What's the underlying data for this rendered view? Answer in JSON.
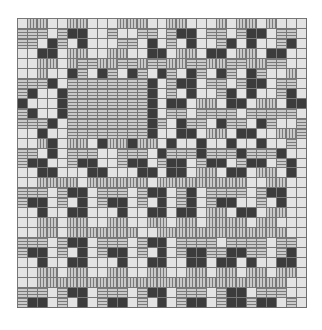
{
  "figure": {
    "type": "weave-draft-pattern",
    "columns": 29,
    "rows": 29,
    "legend": {
      ".": "light cell",
      "v": "vertical-striped cell",
      "h": "horizontal-striped cell",
      "d": "dark cell",
      "m": "mid-gray cell"
    },
    "colors": {
      "light": "#e3e3e3",
      "stripe_light": "#c9c9c9",
      "stripe_dark": "#7a7a7a",
      "dark": "#3c3c3c",
      "mid": "#8f8f8f",
      "grid_line": "#777777"
    },
    "grid": [
      ".vv..vv...vvv..vv...v.vv.v..",
      "hhh.hdd..h..hh.hdd.hh.hdd.hh.",
      "hh.dh.d...hh.d.h.d..hd.d..hd.",
      "..dd.vv..vv..dd.vv.dd.vv.dd..",
      "..vv.vhhvvhhvhhvvhhvvhhvvhh..",
      "..v..dh.dh.dh.dh.dh.dh.dh..v.",
      "hhhd.hhhhhhhhd.hdd.hh.hdd.hh.",
      "hd..dhhhhhhhhd.h.d..hd.d..hd.",
      "d...dhhhhhhhhd.dd.vv.dd.vv.dd",
      "hd..dhhhhhhhhd.hh.hhhh.hhhhh.",
      "hhhd.hhhhhhhhdh.dhh.dhh.dh..h",
      "..d..hhhhhhhhd..dd.vv.dd..vvh",
      "..vd.vv.dvvdvv.d..d..d..d..h",
      "hh.d.hhh..hhh.dhhhdhhhdhhhd.",
      "hdd..hdd..hdd.hdd.hdd.hdd.hd.",
      "..dd...dd...dd.dd.vv.dd.vv.d.",
      "..vvvv.vvvvvv.vvvvvvvvv..vv..",
      "hhh.hdd.hhh.hdd.hd.hhhh.hdd..",
      "hdd.h.d.hdd.h.d.hd.hdd..h.d..",
      "..d..dd...d..dd.dd.vv.dd.vv..",
      "..vv.vv..vv..vv.vv.vvvv.vv...",
      "..vv.vvvvvvv..vvvvvvvvvvvvv..",
      "hhh.hdd.hhh.hdd.hhhh.hhhh.hh.",
      "hdd.h.d.hdd.h.d.hddhhddhh.hd.",
      "..d..dd...d..dd..dd.dd.d..dd.",
      "..vv.vv..vv..vv..vv.vv.vv.vv.",
      "..vvvvvvvvvvvvvvvvvvvvvvvvv..",
      "hhh.hdd.hhh.hdd.hhh.hdd.hhh..",
      "hdd.h.d.hdd.h.d.hdd.hddhdd.h."
    ]
  }
}
